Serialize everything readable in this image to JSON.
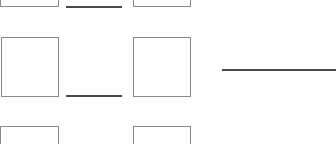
{
  "form": {
    "boxes": [
      {
        "id": "box-r1-c1",
        "x": 0,
        "y": -52,
        "w": 59,
        "h": 59,
        "value": ""
      },
      {
        "id": "box-r1-c2",
        "x": 133,
        "y": -52,
        "w": 58,
        "h": 59,
        "value": ""
      },
      {
        "id": "box-r2-c1",
        "x": 1,
        "y": 37,
        "w": 58,
        "h": 60,
        "value": ""
      },
      {
        "id": "box-r2-c2",
        "x": 133,
        "y": 37,
        "w": 58,
        "h": 60,
        "value": ""
      },
      {
        "id": "box-r3-c1",
        "x": 0,
        "y": 126,
        "w": 59,
        "h": 60,
        "value": ""
      },
      {
        "id": "box-r3-c2",
        "x": 133,
        "y": 126,
        "w": 58,
        "h": 60,
        "value": ""
      }
    ],
    "lines": [
      {
        "id": "blank-line-1",
        "x": 66,
        "y": 6,
        "w": 56,
        "value": ""
      },
      {
        "id": "blank-line-2",
        "x": 66,
        "y": 95,
        "w": 56,
        "value": ""
      },
      {
        "id": "blank-line-3",
        "x": 222,
        "y": 69,
        "w": 114,
        "value": ""
      }
    ],
    "colors": {
      "box_border": "#8a8a8a",
      "line": "#4a4a4a",
      "background": "#ffffff"
    }
  }
}
